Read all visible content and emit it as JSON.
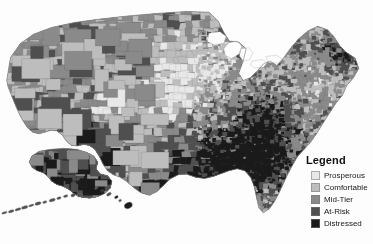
{
  "map": {
    "name": "united-states-county-choropleth",
    "projection": "albers-usa",
    "background_color": "#fdfdfd",
    "border_color": "#8a8a8a",
    "insets": [
      {
        "name": "alaska",
        "label": "Alaska"
      },
      {
        "name": "hawaii",
        "label": "Hawaii"
      }
    ]
  },
  "legend": {
    "title": "Legend",
    "items": [
      {
        "label": "Prosperous",
        "color": "#e8e8e8"
      },
      {
        "label": "Comfortable",
        "color": "#bdbdbd"
      },
      {
        "label": "Mid-Tier",
        "color": "#8a8a8a"
      },
      {
        "label": "At-Risk",
        "color": "#4f4f4f"
      },
      {
        "label": "Distressed",
        "color": "#1a1a1a"
      }
    ]
  },
  "chart_data": {
    "type": "choropleth",
    "title": "",
    "legend_title": "Legend",
    "palette": [
      "#e8e8e8",
      "#bdbdbd",
      "#8a8a8a",
      "#4f4f4f",
      "#1a1a1a"
    ],
    "categories": [
      "Prosperous",
      "Comfortable",
      "Mid-Tier",
      "At-Risk",
      "Distressed"
    ],
    "unit": "county",
    "regional_summary": [
      {
        "region": "Pacific Northwest",
        "dominant": "Mid-Tier",
        "note": "mixed light and dark counties"
      },
      {
        "region": "Great Plains",
        "dominant": "Comfortable",
        "note": "large pale blocks across Nebraska and Kansas"
      },
      {
        "region": "Upper Midwest",
        "dominant": "Prosperous",
        "note": "lightest cluster near Minnesota and Iowa"
      },
      {
        "region": "Appalachia",
        "dominant": "Distressed",
        "note": "dark band through Kentucky and West Virginia"
      },
      {
        "region": "Deep South",
        "dominant": "Distressed",
        "note": "darkest concentration in Mississippi Delta"
      },
      {
        "region": "Texas Border",
        "dominant": "At-Risk",
        "note": "dark counties along the Rio Grande"
      },
      {
        "region": "Northeast Corridor",
        "dominant": "Comfortable",
        "note": "pale urban counties with dark Maine interior"
      },
      {
        "region": "Alaska",
        "dominant": "At-Risk",
        "note": "dark interior boroughs"
      },
      {
        "region": "Hawaii",
        "dominant": "At-Risk",
        "note": "uniformly dark islands"
      }
    ]
  }
}
